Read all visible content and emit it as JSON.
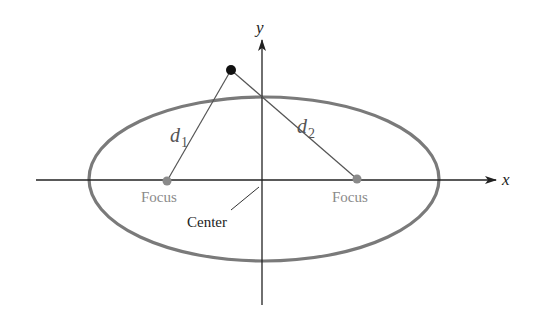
{
  "diagram": {
    "axes": {
      "x_label": "x",
      "y_label": "y"
    },
    "labels": {
      "focus_left": "Focus",
      "focus_right": "Focus",
      "center": "Center",
      "d1": "d",
      "d1_sub": "1",
      "d2": "d",
      "d2_sub": "2"
    },
    "colors": {
      "ellipse": "#7a7a7a",
      "focus": "#8a8a8a",
      "focus_text": "#8a8a8a",
      "axis": "#222222",
      "point": "#111111",
      "line": "#555555"
    }
  }
}
